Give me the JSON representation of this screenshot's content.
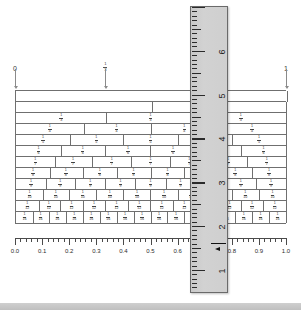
{
  "page": {
    "background_color": "#ffffff",
    "width": 301,
    "height": 318
  },
  "top_axis": {
    "labels": [
      {
        "text": "0",
        "kind": "number",
        "x_frac": 0.0
      },
      {
        "text": "1/3",
        "num": "1",
        "den": "3",
        "kind": "fraction",
        "x_frac": 0.3333
      },
      {
        "text": "2/3",
        "num": "2",
        "den": "3",
        "kind": "fraction",
        "x_frac": 0.6667
      },
      {
        "text": "1",
        "kind": "number",
        "x_frac": 1.0
      }
    ],
    "tick_color": "#8a8a8a"
  },
  "wall": {
    "left_px": 15,
    "top_px": 90,
    "width_px": 271,
    "row_height_px": 11,
    "line_color": "#6f6f6f",
    "rows": [
      {
        "denominator": 1,
        "label_cells": false,
        "cells": [
          "1/1"
        ]
      },
      {
        "denominator": 2,
        "label_cells": false,
        "cells": [
          "1/2",
          "1/2"
        ]
      },
      {
        "denominator": 3,
        "label_cells": true,
        "cells": [
          "1/3",
          "1/3",
          "1/3"
        ]
      },
      {
        "denominator": 4,
        "label_cells": true,
        "cells": [
          "1/4",
          "1/4",
          "1/4",
          "1/4"
        ]
      },
      {
        "denominator": 5,
        "label_cells": true,
        "cells": [
          "1/5",
          "1/5",
          "1/5",
          "1/5",
          "1/5"
        ]
      },
      {
        "denominator": 6,
        "label_cells": true,
        "cells": [
          "1/6",
          "1/6",
          "1/6",
          "1/6",
          "1/6",
          "1/6"
        ]
      },
      {
        "denominator": 7,
        "label_cells": true,
        "cells": [
          "1/7",
          "1/7",
          "1/7",
          "1/7",
          "1/7",
          "1/7",
          "1/7"
        ]
      },
      {
        "denominator": 8,
        "label_cells": true,
        "cells": [
          "1/8",
          "1/8",
          "1/8",
          "1/8",
          "1/8",
          "1/8",
          "1/8",
          "1/8"
        ]
      },
      {
        "denominator": 9,
        "label_cells": true,
        "cells": [
          "1/9",
          "1/9",
          "1/9",
          "1/9",
          "1/9",
          "1/9",
          "1/9",
          "1/9",
          "1/9"
        ]
      },
      {
        "denominator": 10,
        "label_cells": true,
        "cells": [
          "1/10",
          "1/10",
          "1/10",
          "1/10",
          "1/10",
          "1/10",
          "1/10",
          "1/10",
          "1/10",
          "1/10"
        ]
      },
      {
        "denominator": 12,
        "label_cells": true,
        "cells": [
          "1/12",
          "1/12",
          "1/12",
          "1/12",
          "1/12",
          "1/12",
          "1/12",
          "1/12",
          "1/12",
          "1/12",
          "1/12",
          "1/12"
        ]
      },
      {
        "denominator": 16,
        "label_cells": true,
        "cells": [
          "1/16",
          "1/16",
          "1/16",
          "1/16",
          "1/16",
          "1/16",
          "1/16",
          "1/16",
          "1/16",
          "1/16",
          "1/16",
          "1/16",
          "1/16",
          "1/16",
          "1/16",
          "1/16"
        ]
      }
    ]
  },
  "decimal_ruler": {
    "min": 0.0,
    "max": 1.0,
    "major_step": 0.1,
    "minor_per_major": 5,
    "labels": [
      "0.0",
      "0.1",
      "0.2",
      "0.3",
      "0.4",
      "0.5",
      "0.6",
      "0.7",
      "0.8",
      "0.9",
      "1.0"
    ],
    "tick_color": "#4a4a4a"
  },
  "vertical_ruler": {
    "kind": "physical-ruler-overlay",
    "left_px": 190,
    "top_px": 6,
    "width_px": 38,
    "height_px": 287,
    "body_color": "#cfcfcf",
    "edge_color": "#6a6a6a",
    "numbers": [
      "6",
      "5",
      "4",
      "3",
      "2",
      "1"
    ],
    "units_per_number": 1,
    "subdivisions_per_unit": 10,
    "cursor_label": "measurement-cursor"
  },
  "bottom_band": {
    "color": "#cfcfcf"
  }
}
